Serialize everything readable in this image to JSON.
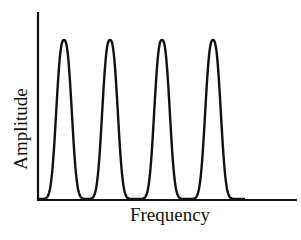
{
  "chart_data": {
    "type": "line",
    "title": "",
    "xlabel": "Frequency",
    "ylabel": "Amplitude",
    "x_ticks": [],
    "y_ticks": [],
    "grid": false,
    "legend": null,
    "peaks": [
      {
        "x_px": 64,
        "relative_amplitude": 1.0
      },
      {
        "x_px": 110,
        "relative_amplitude": 1.0
      },
      {
        "x_px": 162,
        "relative_amplitude": 1.0
      },
      {
        "x_px": 213,
        "relative_amplitude": 1.0
      }
    ],
    "baseline_amplitude": 0,
    "colors": {
      "line": "#111111",
      "axes": "#111111",
      "background": "#ffffff"
    }
  }
}
